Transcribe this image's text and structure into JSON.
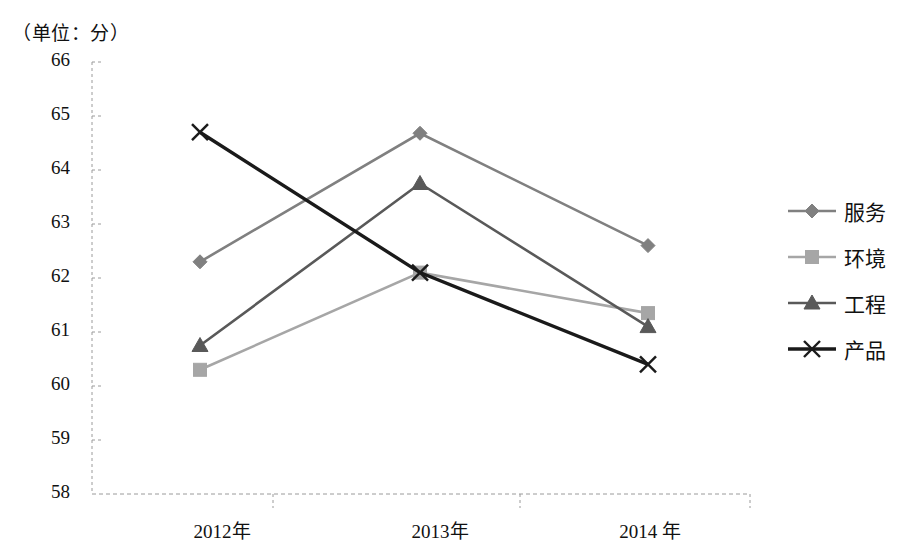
{
  "chart_data": {
    "type": "line",
    "title": "",
    "unit_note": "（单位：分）",
    "xlabel": "",
    "ylabel": "",
    "categories": [
      "2012年",
      "2013年",
      "2014 年"
    ],
    "ylim": [
      58,
      66
    ],
    "ytick_labels": [
      "66",
      "65",
      "64",
      "63",
      "62",
      "61",
      "60",
      "59",
      "58"
    ],
    "ytick_values": [
      66,
      65,
      64,
      63,
      62,
      61,
      60,
      59,
      58
    ],
    "grid": true,
    "legend_position": "right",
    "series": [
      {
        "name": "服务",
        "marker": "diamond",
        "color": "#808080",
        "values": [
          62.3,
          64.68,
          62.6
        ]
      },
      {
        "name": "环境",
        "marker": "square",
        "color": "#a6a6a6",
        "values": [
          60.3,
          62.1,
          61.35
        ]
      },
      {
        "name": "工程",
        "marker": "triangle",
        "color": "#595959",
        "values": [
          60.75,
          63.75,
          61.1
        ]
      },
      {
        "name": "产品",
        "marker": "x",
        "color": "#1a1a1a",
        "values": [
          64.7,
          62.1,
          60.4
        ]
      }
    ]
  },
  "legend": {
    "items": [
      {
        "label": "服务"
      },
      {
        "label": "环境"
      },
      {
        "label": "工程"
      },
      {
        "label": "产品"
      }
    ]
  },
  "axes": {
    "unit_note": "（单位：分）",
    "y_labels": [
      "66",
      "65",
      "64",
      "63",
      "62",
      "61",
      "60",
      "59",
      "58"
    ],
    "x_labels": [
      "2012年",
      "2013年",
      "2014 年"
    ]
  }
}
